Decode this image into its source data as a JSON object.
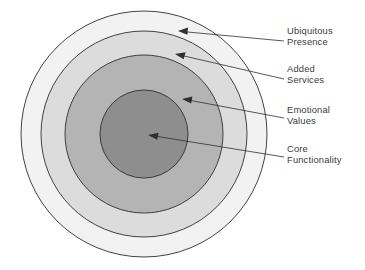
{
  "figure": {
    "background_color": "#ffffff",
    "stroke_color": "#2f2f33",
    "text_color": "#3b3b3f"
  },
  "diagram": {
    "type": "concentric-circles",
    "center": {
      "x": 144,
      "y": 134
    },
    "rings": [
      {
        "id": "ubiquitous-presence",
        "label": "Ubiquitous Presence",
        "label_lines": [
          "Ubiquitous",
          "Presence"
        ],
        "level": 4,
        "radius": 123,
        "fill": "#f2f2f2"
      },
      {
        "id": "added-services",
        "label": "Added Services",
        "label_lines": [
          "Added",
          "Services"
        ],
        "level": 3,
        "radius": 103,
        "fill": "#dcdcdc"
      },
      {
        "id": "emotional-values",
        "label": "Emotional Values",
        "label_lines": [
          "Emotional",
          "Values"
        ],
        "level": 2,
        "radius": 79,
        "fill": "#b4b4b4"
      },
      {
        "id": "core-functionality",
        "label": "Core Functionality",
        "label_lines": [
          "Core",
          "Functionality"
        ],
        "level": 1,
        "radius": 44,
        "fill": "#8e8e8e"
      }
    ]
  },
  "callouts": [
    {
      "id": "callout-ubiquitous-presence",
      "line1": "Ubiquitous",
      "line2": "Presence",
      "text_x": 287,
      "text_y1": 34,
      "text_y2": 45,
      "arrow_tip_x": 178,
      "arrow_tip_y": 31,
      "arrow_tail_x": 284,
      "arrow_tail_y": 41
    },
    {
      "id": "callout-added-services",
      "line1": "Added",
      "line2": "Services",
      "text_x": 287,
      "text_y1": 72,
      "text_y2": 83,
      "arrow_tip_x": 175,
      "arrow_tip_y": 54,
      "arrow_tail_x": 284,
      "arrow_tail_y": 79
    },
    {
      "id": "callout-emotional-values",
      "line1": "Emotional",
      "line2": "Values",
      "text_x": 287,
      "text_y1": 113,
      "text_y2": 124,
      "arrow_tip_x": 182,
      "arrow_tip_y": 99,
      "arrow_tail_x": 284,
      "arrow_tail_y": 118
    },
    {
      "id": "callout-core-functionality",
      "line1": "Core",
      "line2": "Functionality",
      "text_x": 287,
      "text_y1": 152,
      "text_y2": 163,
      "arrow_tip_x": 148,
      "arrow_tip_y": 135,
      "arrow_tail_x": 284,
      "arrow_tail_y": 157
    }
  ]
}
